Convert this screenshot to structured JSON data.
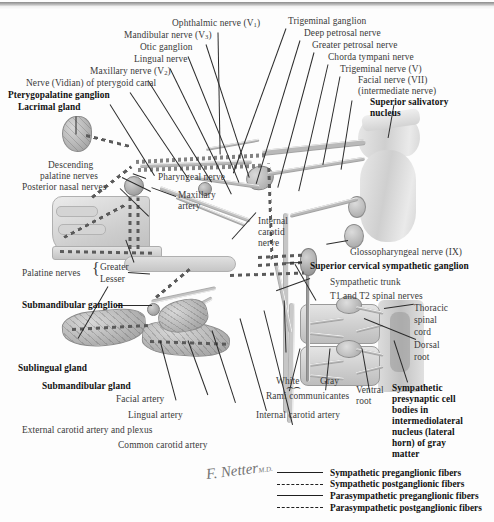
{
  "plate": {
    "signature": "F. Netter",
    "signature_suffix": "M.D."
  },
  "labels": {
    "ophthalmic_nerve": "Ophthalmic nerve (V",
    "ophthalmic_sub": "1",
    "ophthalmic_close": ")",
    "mandibular_nerve": "Mandibular nerve (V",
    "mandibular_sub": "3",
    "mandibular_close": ")",
    "otic_ganglion": "Otic ganglion",
    "lingual_nerve": "Lingual nerve",
    "maxillary_nerve": "Maxillary nerve (V",
    "maxillary_sub": "2",
    "maxillary_close": ")",
    "vidian_nerve": "Nerve (Vidian) of pterygoid canal",
    "pterygopalatine_ganglion": "Pterygopalatine ganglion",
    "lacrimal_gland": "Lacrimal gland",
    "trigeminal_ganglion": "Trigeminal ganglion",
    "deep_petrosal_nerve": "Deep petrosal nerve",
    "greater_petrosal_nerve": "Greater petrosal nerve",
    "chorda_tympani_nerve": "Chorda tympani nerve",
    "trigeminal_nerve": "Trigeminal nerve (V)",
    "facial_nerve": "Facial nerve (VII)",
    "intermediate_nerve": "(intermediate nerve)",
    "superior_salivatory_l1": "Superior salivatory",
    "superior_salivatory_l2": "nucleus",
    "descending_palatine_l1": "Descending",
    "descending_palatine_l2": "palatine nerves",
    "posterior_nasal_nerves": "Posterior nasal nerves",
    "pharyngeal_nerve": "Pharyngeal nerve",
    "maxillary_artery_l1": "Maxillary",
    "maxillary_artery_l2": "artery",
    "internal_carotid_nerve_l1": "Internal",
    "internal_carotid_nerve_l2": "carotid",
    "internal_carotid_nerve_l3": "nerve",
    "glossopharyngeal_nerve": "Glossopharyngeal nerve (IX)",
    "palatine_nerves": "Palatine nerves",
    "greater": "Greater",
    "lesser": "Lesser",
    "superior_cervical_ganglion": "Superior cervical sympathetic ganglion",
    "sympathetic_trunk": "Sympathetic trunk",
    "t1_t2_spinal_nerves": "T1 and T2 spinal nerves",
    "thoracic_l1": "Thoracic",
    "thoracic_l2": "spinal",
    "thoracic_l3": "cord",
    "dorsal_l1": "Dorsal",
    "dorsal_l2": "root",
    "submandibular_ganglion": "Submandibular ganglion",
    "sublingual_gland": "Sublingual gland",
    "submandibular_gland": "Submandibular gland",
    "facial_artery": "Facial artery",
    "lingual_artery": "Lingual artery",
    "external_carotid": "External carotid artery and plexus",
    "common_carotid": "Common carotid artery",
    "white": "White",
    "gray": "Gray",
    "rami_communicantes": "Rami communicantes",
    "internal_carotid_artery": "Internal carotid artery",
    "ventral_l1": "Ventral",
    "ventral_l2": "root",
    "sympathetic_presynaptic_l1": "Sympathetic",
    "sympathetic_presynaptic_l2": "presynaptic cell",
    "sympathetic_presynaptic_l3": "bodies in",
    "sympathetic_presynaptic_l4": "intermediolateral",
    "sympathetic_presynaptic_l5": "nucleus (lateral",
    "sympathetic_presynaptic_l6": "horn) of gray",
    "sympathetic_presynaptic_l7": "matter"
  },
  "legend": {
    "items": [
      {
        "style": "solid",
        "label": "Sympathetic preganglionic fibers"
      },
      {
        "style": "dashed",
        "label": "Sympathetic postganglionic fibers"
      },
      {
        "style": "solid",
        "label": "Parasympathetic preganglionic fibers"
      },
      {
        "style": "dashed",
        "label": "Parasympathetic postganglionic fibers"
      }
    ]
  },
  "colors": {
    "ink": "#3a3a3a",
    "bold_ink": "#111111",
    "leader": "#2b2b2b",
    "anatomy_light": "#e4e4e4",
    "anatomy_mid": "#b9b9b9",
    "anatomy_dark": "#8f8f8f",
    "background": "#fdfdfd"
  }
}
